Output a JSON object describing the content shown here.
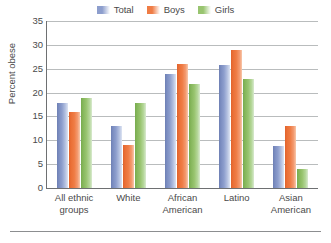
{
  "chart_data": {
    "type": "bar",
    "title": "",
    "subtitle": "",
    "xlabel": "",
    "ylabel": "Percent obese",
    "categories": [
      "All ethnic\ngroups",
      "White",
      "African\nAmerican",
      "Latino",
      "Asian\nAmerican"
    ],
    "series": [
      {
        "name": "Total",
        "color": "#8d9ecd",
        "values": [
          17.9,
          13.0,
          23.9,
          25.8,
          8.9
        ]
      },
      {
        "name": "Boys",
        "color": "#ef7c45",
        "values": [
          16.0,
          9.0,
          25.9,
          28.9,
          12.9
        ]
      },
      {
        "name": "Girls",
        "color": "#98c46f",
        "values": [
          18.9,
          17.9,
          21.9,
          22.9,
          3.9
        ]
      }
    ],
    "ylim": [
      0,
      35
    ],
    "yticks": [
      0,
      5,
      10,
      15,
      20,
      25,
      30,
      35
    ],
    "ytick_labels": [
      "0",
      "5",
      "10",
      "15",
      "20",
      "25",
      "30",
      "35"
    ],
    "grid": true,
    "legend_position": "top-center"
  },
  "legend": {
    "entries": [
      {
        "label": "Total",
        "swatch_color": "#8d9ecd"
      },
      {
        "label": "Boys",
        "swatch_color": "#ef7c45"
      },
      {
        "label": "Girls",
        "swatch_color": "#98c46f"
      }
    ]
  },
  "axes": {
    "y_title": "Percent obese"
  },
  "colors": {
    "gridline": "#b9bcbd",
    "axis_line": "#6e7072",
    "tick_text": "#4a4a4a",
    "footer_rule": "#8c8e90",
    "background": "#ffffff"
  }
}
